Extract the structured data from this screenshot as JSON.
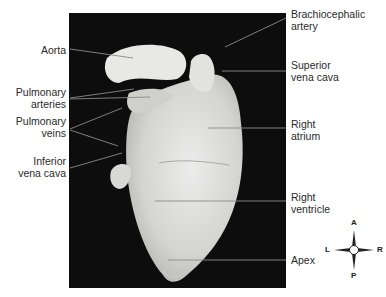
{
  "figure": {
    "type": "anatomical photograph",
    "background_color": "#0d0d0d",
    "tissue_color": "#d9d9d4"
  },
  "labels_left": [
    {
      "id": "aorta",
      "lines": [
        "Aorta"
      ]
    },
    {
      "id": "pulmonary-arteries",
      "lines": [
        "Pulmonary",
        "arteries"
      ]
    },
    {
      "id": "pulmonary-veins",
      "lines": [
        "Pulmonary",
        "veins"
      ]
    },
    {
      "id": "inferior-vena-cava",
      "lines": [
        "Inferior",
        "vena cava"
      ]
    }
  ],
  "labels_right": [
    {
      "id": "brachiocephalic-artery",
      "lines": [
        "Brachiocephalic",
        "artery"
      ]
    },
    {
      "id": "superior-vena-cava",
      "lines": [
        "Superior",
        "vena cava"
      ]
    },
    {
      "id": "right-atrium",
      "lines": [
        "Right",
        "atrium"
      ]
    },
    {
      "id": "right-ventricle",
      "lines": [
        "Right",
        "ventricle"
      ]
    },
    {
      "id": "apex",
      "lines": [
        "Apex"
      ]
    }
  ],
  "compass": {
    "top": "A",
    "bottom": "P",
    "left": "L",
    "right": "R"
  }
}
